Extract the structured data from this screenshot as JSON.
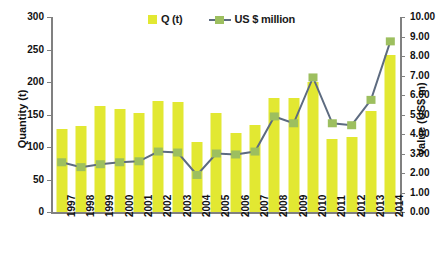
{
  "chart_data": {
    "type": "bar",
    "title": "",
    "subtitle": "",
    "xlabel": "",
    "ylabel": "Quantity (t)",
    "y2label": "Value (US$ m)",
    "grid": false,
    "legend_position": "top-center",
    "categories": [
      "1997",
      "1998",
      "1999",
      "2000",
      "2001",
      "2002",
      "2003",
      "2004",
      "2005",
      "2006",
      "2007",
      "2008",
      "2009",
      "2010",
      "2011",
      "2012",
      "2013",
      "2014"
    ],
    "ylim": [
      0,
      300
    ],
    "yticks": [
      "0",
      "50",
      "100",
      "150",
      "200",
      "250",
      "300"
    ],
    "y2lim": [
      0,
      10
    ],
    "y2ticks": [
      "0.00",
      "1.00",
      "2.00",
      "3.00",
      "4.00",
      "5.00",
      "6.00",
      "7.00",
      "8.00",
      "9.00",
      "10.00"
    ],
    "series": [
      {
        "name": "Q (t)",
        "type": "bar",
        "axis": "left",
        "color": "#e2e832",
        "values": [
          128,
          133,
          163,
          158,
          152,
          171,
          170,
          108,
          153,
          122,
          134,
          175,
          175,
          200,
          112,
          115,
          155,
          242
        ]
      },
      {
        "name": "US $ million",
        "type": "line",
        "axis": "right",
        "color": "#5d6b80",
        "marker_color": "#9dbf5f",
        "values": [
          2.55,
          2.3,
          2.45,
          2.55,
          2.6,
          3.1,
          3.05,
          1.9,
          3.0,
          2.95,
          3.1,
          4.9,
          4.55,
          6.9,
          4.55,
          4.45,
          5.75,
          8.75
        ]
      }
    ]
  },
  "legend": {
    "entries": [
      {
        "label": "Q (t)",
        "icon": "square-swatch-icon"
      },
      {
        "label": "US $ million",
        "icon": "line-marker-icon"
      }
    ]
  },
  "axes": {
    "left_title": "Quantity (t)",
    "right_title": "Value (US$ m)"
  },
  "colors": {
    "bar": "#e2e832",
    "line": "#5d6b80",
    "marker": "#9dbf5f",
    "axis": "#808080",
    "text": "#111111",
    "background": "#ffffff"
  }
}
